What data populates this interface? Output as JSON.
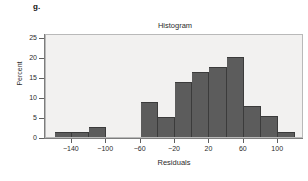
{
  "figure": {
    "part_label": "g."
  },
  "chart_data": {
    "type": "bar",
    "title": "Histogram",
    "xlabel": "Residuals",
    "ylabel": "Percent",
    "grid": false,
    "legend": null,
    "xlim": [
      -170,
      130
    ],
    "ylim": [
      0,
      26
    ],
    "ytick_labels": [
      "0",
      "5",
      "10",
      "15",
      "20",
      "25"
    ],
    "ytick_values": [
      0,
      5,
      10,
      15,
      20,
      25
    ],
    "xtick_labels": [
      "−140",
      "−100",
      "−60",
      "−20",
      "20",
      "60",
      "100"
    ],
    "xtick_values": [
      -140,
      -100,
      -60,
      -20,
      20,
      60,
      100
    ],
    "bin_width": 20,
    "bin_edges": [
      -160,
      -140,
      -120,
      -100,
      -80,
      -60,
      -40,
      -20,
      0,
      20,
      40,
      60,
      80,
      100,
      120
    ],
    "bin_centers": [
      -150,
      -130,
      -110,
      -90,
      -70,
      -50,
      -30,
      -10,
      10,
      30,
      50,
      70,
      90,
      110
    ],
    "categories": [
      "-160 to -140",
      "-140 to -120",
      "-120 to -100",
      "-100 to -80",
      "-80 to -60",
      "-60 to -40",
      "-40 to -20",
      "-20 to 0",
      "0 to 20",
      "20 to 40",
      "40 to 60",
      "60 to 80",
      "80 to 100",
      "100 to 120"
    ],
    "values": [
      1.2,
      1.2,
      2.4,
      0,
      0,
      8.8,
      5.0,
      13.8,
      16.3,
      17.5,
      20.1,
      7.8,
      5.2,
      1.2
    ],
    "bar_color": "#5c5c5c",
    "bar_edge_color": "#3b3b3b",
    "plot_background": "#f2f1f0",
    "plot_border_color": "#b9b9b9",
    "axis_color": "#7d7d7d",
    "text_color": "#2b2b2b"
  }
}
